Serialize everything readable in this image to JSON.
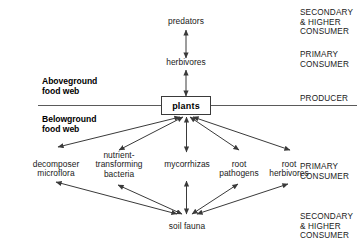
{
  "figure": {
    "type": "diagram",
    "subtype": "food-web-schematic",
    "background_color": "#ffffff",
    "line_color": "#3a3a3a",
    "text_color": "#1a1a1a"
  },
  "sections": {
    "aboveground": {
      "label": "Aboveground\nfood web",
      "line1": "Aboveground",
      "line2": "food web"
    },
    "belowground": {
      "label": "Belowground\nfood web",
      "line1": "Belowground",
      "line2": "food web"
    }
  },
  "center_node": {
    "label": "plants",
    "name": "plants-box"
  },
  "aboveground_nodes": [
    {
      "id": "predators",
      "label": "predators"
    },
    {
      "id": "herbivores",
      "label": "herbivores"
    }
  ],
  "belowground_nodes": [
    {
      "id": "decomposer-microflora",
      "lines": [
        "decomposer",
        "microflora"
      ]
    },
    {
      "id": "nutrient-transforming-bacteria",
      "lines": [
        "nutrient-",
        "transforming",
        "bacteria"
      ]
    },
    {
      "id": "mycorrhizas",
      "lines": [
        "mycorrhizas"
      ]
    },
    {
      "id": "root-pathogens",
      "lines": [
        "root",
        "pathogens"
      ]
    },
    {
      "id": "root-herbivores",
      "lines": [
        "root",
        "herbivores"
      ]
    }
  ],
  "bottom_node": {
    "id": "soil-fauna",
    "label": "soil fauna"
  },
  "trophic_labels": [
    {
      "id": "secondary-higher-consumer-top",
      "lines": [
        "SECONDARY",
        "& HIGHER",
        "CONSUMER"
      ]
    },
    {
      "id": "primary-consumer-top",
      "lines": [
        "PRIMARY",
        "CONSUMER"
      ]
    },
    {
      "id": "producer",
      "lines": [
        "PRODUCER"
      ]
    },
    {
      "id": "primary-consumer-bottom",
      "lines": [
        "PRIMARY",
        "CONSUMER"
      ]
    },
    {
      "id": "secondary-higher-consumer-bottom",
      "lines": [
        "SECONDARY",
        "& HIGHER",
        "CONSUMER"
      ]
    }
  ],
  "connections": [
    {
      "from": "predators",
      "to": "herbivores",
      "style": "double-headed"
    },
    {
      "from": "herbivores",
      "to": "plants",
      "style": "double-headed"
    },
    {
      "from": "plants",
      "to": "decomposer-microflora",
      "style": "double-headed"
    },
    {
      "from": "plants",
      "to": "nutrient-transforming-bacteria",
      "style": "double-headed"
    },
    {
      "from": "plants",
      "to": "mycorrhizas",
      "style": "double-headed"
    },
    {
      "from": "plants",
      "to": "root-pathogens",
      "style": "double-headed"
    },
    {
      "from": "plants",
      "to": "root-herbivores",
      "style": "double-headed"
    },
    {
      "from": "decomposer-microflora",
      "to": "soil-fauna",
      "style": "double-headed"
    },
    {
      "from": "nutrient-transforming-bacteria",
      "to": "soil-fauna",
      "style": "double-headed"
    },
    {
      "from": "mycorrhizas",
      "to": "soil-fauna",
      "style": "double-headed"
    },
    {
      "from": "root-pathogens",
      "to": "soil-fauna",
      "style": "double-headed"
    },
    {
      "from": "root-herbivores",
      "to": "soil-fauna",
      "style": "double-headed"
    }
  ]
}
